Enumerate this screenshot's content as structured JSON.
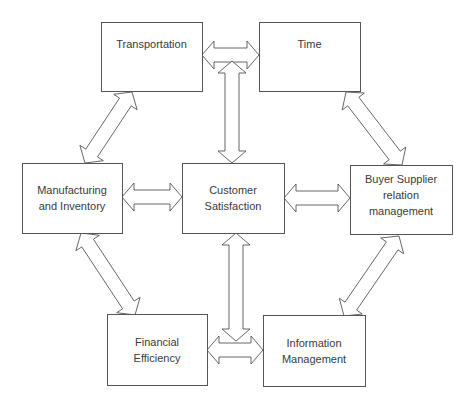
{
  "diagram": {
    "title": "",
    "colors": {
      "stroke": "#555555",
      "fill": "#ffffff",
      "text": "#3a3a3a"
    },
    "nodes": [
      {
        "id": "transportation",
        "lines": [
          "Transportation"
        ],
        "x": 101,
        "y": 22,
        "w": 101,
        "h": 69
      },
      {
        "id": "time",
        "lines": [
          "Time"
        ],
        "x": 259,
        "y": 22,
        "w": 101,
        "h": 69
      },
      {
        "id": "manufacturing",
        "lines": [
          "Manufacturing",
          "and Inventory"
        ],
        "x": 22,
        "y": 163,
        "w": 100,
        "h": 70
      },
      {
        "id": "customer",
        "lines": [
          "Customer",
          "Satisfaction"
        ],
        "x": 182,
        "y": 163,
        "w": 102,
        "h": 70
      },
      {
        "id": "buyer",
        "lines": [
          "Buyer Supplier",
          "relation",
          "management"
        ],
        "x": 350,
        "y": 165,
        "w": 102,
        "h": 69
      },
      {
        "id": "financial",
        "lines": [
          "Financial",
          "Efficiency"
        ],
        "x": 107,
        "y": 314,
        "w": 100,
        "h": 71
      },
      {
        "id": "information",
        "lines": [
          "Information",
          "Management"
        ],
        "x": 263,
        "y": 315,
        "w": 102,
        "h": 71
      }
    ],
    "edges": [
      {
        "from": "transportation",
        "to": "time",
        "type": "double-arrow",
        "p1": [
          202,
          55
        ],
        "p2": [
          259,
          55
        ]
      },
      {
        "from": "time",
        "to": "customer",
        "type": "double-arrow",
        "p1": [
          232,
          61
        ],
        "p2": [
          232,
          163
        ]
      },
      {
        "from": "transportation",
        "to": "manufacturing",
        "type": "double-arrow",
        "p1": [
          132,
          92
        ],
        "p2": [
          85,
          163
        ]
      },
      {
        "from": "time",
        "to": "buyer",
        "type": "double-arrow",
        "p1": [
          346,
          92
        ],
        "p2": [
          402,
          165
        ]
      },
      {
        "from": "manufacturing",
        "to": "customer",
        "type": "double-arrow",
        "p1": [
          122,
          197
        ],
        "p2": [
          182,
          197
        ]
      },
      {
        "from": "customer",
        "to": "buyer",
        "type": "double-arrow",
        "p1": [
          284,
          198
        ],
        "p2": [
          350,
          198
        ]
      },
      {
        "from": "manufacturing",
        "to": "financial",
        "type": "double-arrow",
        "p1": [
          81,
          233
        ],
        "p2": [
          135,
          315
        ]
      },
      {
        "from": "buyer",
        "to": "information",
        "type": "double-arrow",
        "p1": [
          399,
          236
        ],
        "p2": [
          344,
          316
        ]
      },
      {
        "from": "customer",
        "to": "financial-information",
        "type": "double-arrow",
        "p1": [
          236,
          233
        ],
        "p2": [
          236,
          341
        ]
      },
      {
        "from": "financial",
        "to": "information",
        "type": "double-arrow",
        "p1": [
          207,
          350
        ],
        "p2": [
          263,
          350
        ]
      }
    ]
  }
}
